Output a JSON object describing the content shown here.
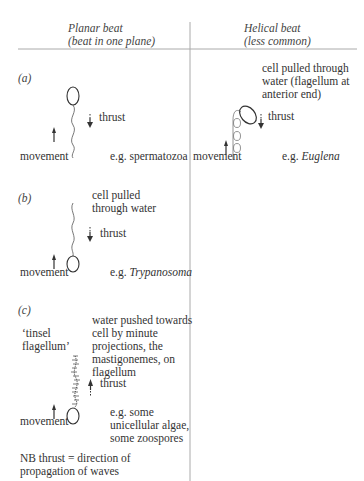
{
  "columns": {
    "planar": {
      "title": "Planar beat",
      "subtitle": "(beat in one plane)"
    },
    "helical": {
      "title": "Helical beat",
      "subtitle": "(less common)"
    }
  },
  "panels": {
    "a": {
      "label": "(a)",
      "thrust": "thrust",
      "movement": "movement",
      "example_prefix": "e.g. ",
      "example": "spermatozoa"
    },
    "b": {
      "label": "(b)",
      "note_line1": "cell pulled",
      "note_line2": "through water",
      "thrust": "thrust",
      "movement": "movement",
      "example_prefix": "e.g. ",
      "example": "Trypanosoma"
    },
    "c": {
      "label": "(c)",
      "tinsel_line1": "‘tinsel",
      "tinsel_line2": "flagellum’",
      "note_lines": [
        "water pushed towards",
        "cell by minute",
        "projections, the",
        "mastigonemes, on",
        "flagellum"
      ],
      "thrust": "thrust",
      "movement": "movement",
      "example_lines": [
        "e.g. some",
        "unicellular algae,",
        "some zoospores"
      ]
    },
    "helical": {
      "note_lines": [
        "cell pulled through",
        "water (flagellum at",
        "anterior end)"
      ],
      "thrust": "thrust",
      "movement": "movement",
      "example_prefix": "e.g. ",
      "example": "Euglena"
    }
  },
  "footnote": {
    "line1": "NB thrust = direction of",
    "line2": "propagation of waves"
  },
  "colors": {
    "ink": "#333333",
    "rule": "#999999"
  }
}
